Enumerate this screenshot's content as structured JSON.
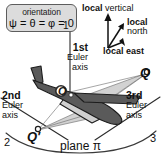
{
  "diagram": {
    "orientation_box": {
      "line1": "orientation",
      "line2": "ψ = θ = φ = 0"
    },
    "euler_axes": [
      {
        "ordinal": "1st",
        "word1": "Euler",
        "word2": "axis"
      },
      {
        "ordinal": "2nd",
        "word1": "Euler",
        "word2": "axis"
      },
      {
        "ordinal": "3rd",
        "word1": "Euler",
        "word2": "axis"
      }
    ],
    "local_frame": {
      "prefix": "local",
      "vertical": "vertical",
      "north": "north",
      "east": "east"
    },
    "points": {
      "origin": "O",
      "q": "Q",
      "q_prime": "Q′",
      "axis_1": "1",
      "axis_2": "2",
      "axis_3": "3"
    },
    "plane_label": "plane π",
    "colors": {
      "background": "#ffffff",
      "aircraft_body": "#5a5a5a",
      "aircraft_outline": "#1c1c1c",
      "wedge_fill": "#d2d2d2",
      "box_fill": "#dcdcdc",
      "box_border": "#5d5d5d",
      "line": "#2b2b2b",
      "text": "#111111"
    }
  }
}
